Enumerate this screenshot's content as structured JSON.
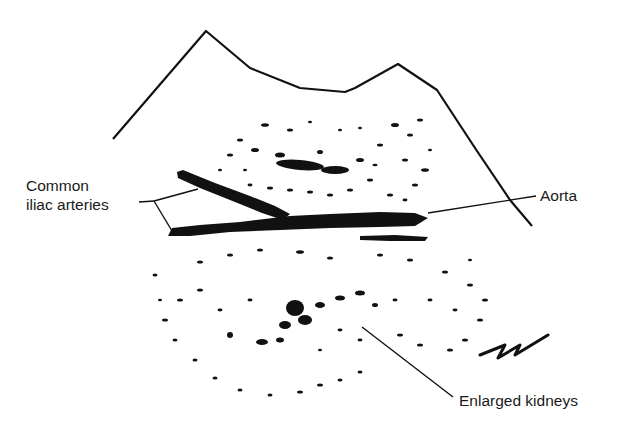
{
  "diagram": {
    "type": "ultrasound schematic",
    "colors": {
      "ink": "#111111",
      "background": "#ffffff"
    },
    "labels": [
      {
        "id": "common-iliac",
        "line1": "Common",
        "line2": "iliac arteries"
      },
      {
        "id": "aorta",
        "text": "Aorta"
      },
      {
        "id": "kidneys",
        "text": "Enlarged kidneys"
      }
    ]
  }
}
